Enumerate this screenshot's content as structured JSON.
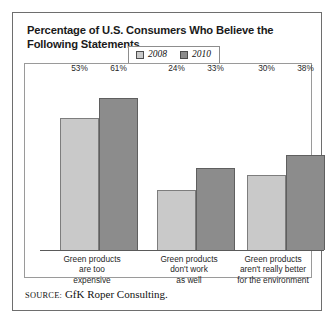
{
  "title": "Percentage of U.S. Consumers Who Believe the Following Statements",
  "legend": {
    "entries": [
      {
        "label": "2008",
        "color": "#c9c9c9",
        "swatch_name": "legend-swatch-2008"
      },
      {
        "label": "2010",
        "color": "#8c8c8c",
        "swatch_name": "legend-swatch-2010"
      }
    ]
  },
  "source": {
    "label": "Source:",
    "text": " GfK Roper Consulting."
  },
  "chart_data": {
    "type": "bar",
    "title": "Percentage of U.S. Consumers Who Believe the Following Statements",
    "xlabel": "",
    "ylabel": "",
    "ylim": [
      0,
      70
    ],
    "grid": false,
    "legend_position": "top-center",
    "categories": [
      "Green products are too expensive",
      "Green products don't work as well",
      "Green products aren't really better for the environment"
    ],
    "category_lines": [
      [
        "Green products",
        "are too",
        "expensive"
      ],
      [
        "Green products",
        "don't work",
        "as well"
      ],
      [
        "Green products",
        "aren't really better",
        "for the environment"
      ]
    ],
    "series": [
      {
        "name": "2008",
        "color": "#c9c9c9",
        "values": [
          53,
          61,
          24
        ],
        "value_labels": [
          "53%",
          "61%",
          "24%"
        ]
      },
      {
        "name": "2010",
        "color": "#8c8c8c",
        "values": [
          33,
          30,
          38
        ],
        "value_labels": [
          "33%",
          "30%",
          "38%"
        ]
      }
    ],
    "groups": [
      {
        "category_lines": [
          "Green products",
          "are too",
          "expensive"
        ],
        "bars": [
          {
            "series": "2008",
            "value": 53,
            "label": "53%"
          },
          {
            "series": "2010",
            "value": 61,
            "label": "61%"
          }
        ]
      },
      {
        "category_lines": [
          "Green products",
          "don't work",
          "as well"
        ],
        "bars": [
          {
            "series": "2008",
            "value": 24,
            "label": "24%"
          },
          {
            "series": "2010",
            "value": 33,
            "label": "33%"
          }
        ]
      },
      {
        "category_lines": [
          "Green products",
          "aren't really better",
          "for the environment"
        ],
        "bars": [
          {
            "series": "2008",
            "value": 30,
            "label": "30%"
          },
          {
            "series": "2010",
            "value": 38,
            "label": "38%"
          }
        ]
      }
    ]
  }
}
